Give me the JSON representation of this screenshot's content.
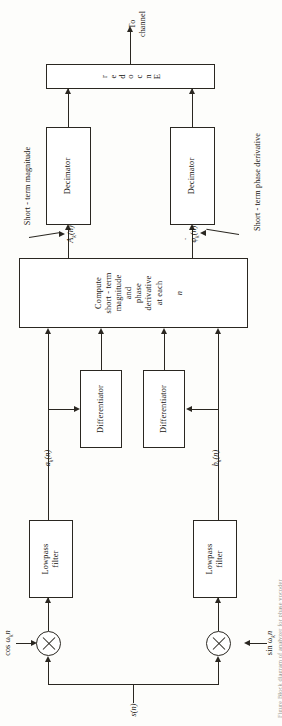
{
  "figure": {
    "orientation": "rotated-90",
    "ink_color": "#2a2721",
    "paper_color": "#fdfdfb"
  },
  "output": {
    "to_channel_label": "To\nchannel"
  },
  "blocks": {
    "encoder": {
      "label": "Encoder",
      "letters": [
        "E",
        "n",
        "c",
        "o",
        "d",
        "e",
        "r"
      ]
    },
    "decimator_top": {
      "label": "Decimator"
    },
    "decimator_bottom": {
      "label": "Decimator"
    },
    "compute": {
      "label": "Compute\nshort - term\nmagnitude\nand\nphase\nderivative\nat each",
      "trailing_italic": "n"
    },
    "differentiator_left": {
      "label": "Differentiator"
    },
    "differentiator_right": {
      "label": "Differentiator"
    },
    "lowpass_top": {
      "label": "Lowpass\nfilter"
    },
    "lowpass_bottom": {
      "label": "Lowpass\nfilter"
    }
  },
  "signals": {
    "input": "s(n)",
    "carrier_cos": "cos ω",
    "carrier_cos_sub": "k",
    "carrier_cos_tail": "n",
    "carrier_sin": "sin ω",
    "carrier_sin_sub": "k",
    "carrier_sin_tail": "n",
    "a_k": "a",
    "a_k_sub": "k",
    "a_k_tail": "(n)",
    "b_k": "b",
    "b_k_sub": "k",
    "b_k_tail": "(n)",
    "A_k": "A",
    "A_k_sub": "k",
    "A_k_tail": "(n)",
    "phi_k": "φ",
    "phi_k_sub": "k",
    "phi_k_tail": "(n)"
  },
  "annotations": {
    "short_term_magnitude": "Short - term magnitude",
    "short_term_phase_derivative": "Short - term phase derivative"
  },
  "caption": {
    "text": "Figure  Block diagram of analyzer for phase vocoder"
  }
}
